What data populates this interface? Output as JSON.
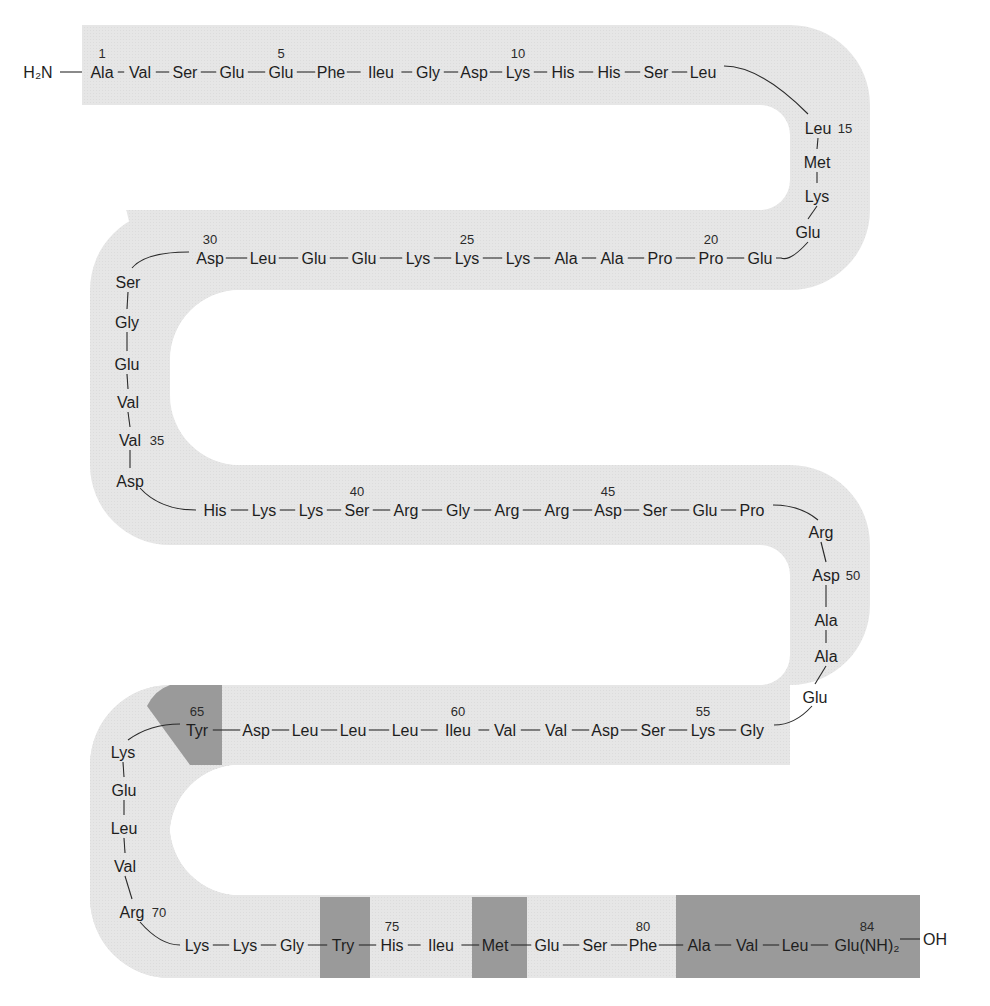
{
  "diagram": {
    "type": "peptide-sequence",
    "n_terminus": "H2N",
    "n_terminus_display": "H₂N",
    "c_terminus": "OH",
    "total_residues": 84,
    "colors": {
      "band": "#e6e6e6",
      "highlight": "#9a9a9a",
      "text": "#1e1e1e",
      "background": "#ffffff"
    },
    "residues": [
      {
        "pos": 1,
        "name": "Ala",
        "label": "1"
      },
      {
        "pos": 2,
        "name": "Val"
      },
      {
        "pos": 3,
        "name": "Ser"
      },
      {
        "pos": 4,
        "name": "Glu"
      },
      {
        "pos": 5,
        "name": "Glu",
        "label": "5"
      },
      {
        "pos": 6,
        "name": "Phe"
      },
      {
        "pos": 7,
        "name": "Ileu"
      },
      {
        "pos": 8,
        "name": "Gly"
      },
      {
        "pos": 9,
        "name": "Asp"
      },
      {
        "pos": 10,
        "name": "Lys",
        "label": "10"
      },
      {
        "pos": 11,
        "name": "His"
      },
      {
        "pos": 12,
        "name": "His"
      },
      {
        "pos": 13,
        "name": "Ser"
      },
      {
        "pos": 14,
        "name": "Leu"
      },
      {
        "pos": 15,
        "name": "Leu",
        "label": "15"
      },
      {
        "pos": 16,
        "name": "Met"
      },
      {
        "pos": 17,
        "name": "Lys"
      },
      {
        "pos": 18,
        "name": "Glu"
      },
      {
        "pos": 19,
        "name": "Glu"
      },
      {
        "pos": 20,
        "name": "Pro",
        "label": "20"
      },
      {
        "pos": 21,
        "name": "Pro"
      },
      {
        "pos": 22,
        "name": "Ala"
      },
      {
        "pos": 23,
        "name": "Ala"
      },
      {
        "pos": 24,
        "name": "Lys"
      },
      {
        "pos": 25,
        "name": "Lys",
        "label": "25"
      },
      {
        "pos": 26,
        "name": "Lys"
      },
      {
        "pos": 27,
        "name": "Glu"
      },
      {
        "pos": 28,
        "name": "Glu"
      },
      {
        "pos": 29,
        "name": "Leu"
      },
      {
        "pos": 30,
        "name": "Asp",
        "label": "30"
      },
      {
        "pos": 31,
        "name": "Ser"
      },
      {
        "pos": 32,
        "name": "Gly"
      },
      {
        "pos": 33,
        "name": "Glu"
      },
      {
        "pos": 34,
        "name": "Val"
      },
      {
        "pos": 35,
        "name": "Val",
        "label": "35"
      },
      {
        "pos": 36,
        "name": "Asp"
      },
      {
        "pos": 37,
        "name": "His"
      },
      {
        "pos": 38,
        "name": "Lys"
      },
      {
        "pos": 39,
        "name": "Lys"
      },
      {
        "pos": 40,
        "name": "Ser",
        "label": "40"
      },
      {
        "pos": 41,
        "name": "Arg"
      },
      {
        "pos": 42,
        "name": "Gly"
      },
      {
        "pos": 43,
        "name": "Arg"
      },
      {
        "pos": 44,
        "name": "Arg"
      },
      {
        "pos": 45,
        "name": "Asp",
        "label": "45"
      },
      {
        "pos": 46,
        "name": "Ser"
      },
      {
        "pos": 47,
        "name": "Glu"
      },
      {
        "pos": 48,
        "name": "Pro"
      },
      {
        "pos": 49,
        "name": "Arg"
      },
      {
        "pos": 50,
        "name": "Asp",
        "label": "50"
      },
      {
        "pos": 51,
        "name": "Ala"
      },
      {
        "pos": 52,
        "name": "Ala"
      },
      {
        "pos": 53,
        "name": "Glu"
      },
      {
        "pos": 54,
        "name": "Gly"
      },
      {
        "pos": 55,
        "name": "Lys",
        "label": "55"
      },
      {
        "pos": 56,
        "name": "Ser"
      },
      {
        "pos": 57,
        "name": "Asp"
      },
      {
        "pos": 58,
        "name": "Val"
      },
      {
        "pos": 59,
        "name": "Val"
      },
      {
        "pos": 60,
        "name": "Ileu",
        "label": "60"
      },
      {
        "pos": 61,
        "name": "Leu"
      },
      {
        "pos": 62,
        "name": "Leu"
      },
      {
        "pos": 63,
        "name": "Leu"
      },
      {
        "pos": 64,
        "name": "Asp"
      },
      {
        "pos": 65,
        "name": "Tyr",
        "label": "65",
        "highlighted": true
      },
      {
        "pos": 66,
        "name": "Lys"
      },
      {
        "pos": 67,
        "name": "Glu"
      },
      {
        "pos": 68,
        "name": "Leu"
      },
      {
        "pos": 69,
        "name": "Val"
      },
      {
        "pos": 70,
        "name": "Arg",
        "label": "70"
      },
      {
        "pos": 71,
        "name": "Lys"
      },
      {
        "pos": 72,
        "name": "Lys"
      },
      {
        "pos": 73,
        "name": "Gly"
      },
      {
        "pos": 74,
        "name": "Try",
        "highlighted": true
      },
      {
        "pos": 75,
        "name": "His",
        "label": "75"
      },
      {
        "pos": 76,
        "name": "Ileu"
      },
      {
        "pos": 77,
        "name": "Met",
        "highlighted": true
      },
      {
        "pos": 78,
        "name": "Glu"
      },
      {
        "pos": 79,
        "name": "Ser"
      },
      {
        "pos": 80,
        "name": "Phe",
        "label": "80"
      },
      {
        "pos": 81,
        "name": "Ala",
        "highlighted": true
      },
      {
        "pos": 82,
        "name": "Val",
        "highlighted": true
      },
      {
        "pos": 83,
        "name": "Leu",
        "highlighted": true
      },
      {
        "pos": 84,
        "name": "Glu(NH)2",
        "display": "Glu(NH)₂",
        "label": "84",
        "highlighted": true
      }
    ],
    "highlighted_regions": [
      {
        "name": "tyr-65",
        "residues": [
          65
        ]
      },
      {
        "name": "try-74",
        "residues": [
          74
        ]
      },
      {
        "name": "met-77",
        "residues": [
          77
        ]
      },
      {
        "name": "c-terminal-81-84",
        "residues": [
          81,
          82,
          83,
          84
        ]
      }
    ]
  }
}
